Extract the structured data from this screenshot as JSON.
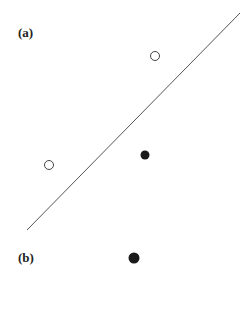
{
  "panels": [
    {
      "label": "(a)",
      "label_pos": [
        18,
        37
      ],
      "line": {
        "x1": 240,
        "y1": 13,
        "x2": 27,
        "y2": 230,
        "color": "#555555"
      },
      "points": [
        {
          "kind": "open",
          "cx": 155,
          "cy": 56,
          "r": 4.5
        },
        {
          "kind": "open",
          "cx": 49,
          "cy": 165,
          "r": 4.5
        },
        {
          "kind": "filled",
          "cx": 145,
          "cy": 155,
          "r": 4.5
        }
      ]
    },
    {
      "label": "(b)",
      "label_pos": [
        18,
        262
      ],
      "points": [
        {
          "kind": "filled",
          "cx": 134,
          "cy": 258,
          "r": 5.5
        }
      ]
    }
  ],
  "colors": {
    "ink": "#1a1a1a",
    "line": "#555555",
    "background": "#ffffff"
  }
}
